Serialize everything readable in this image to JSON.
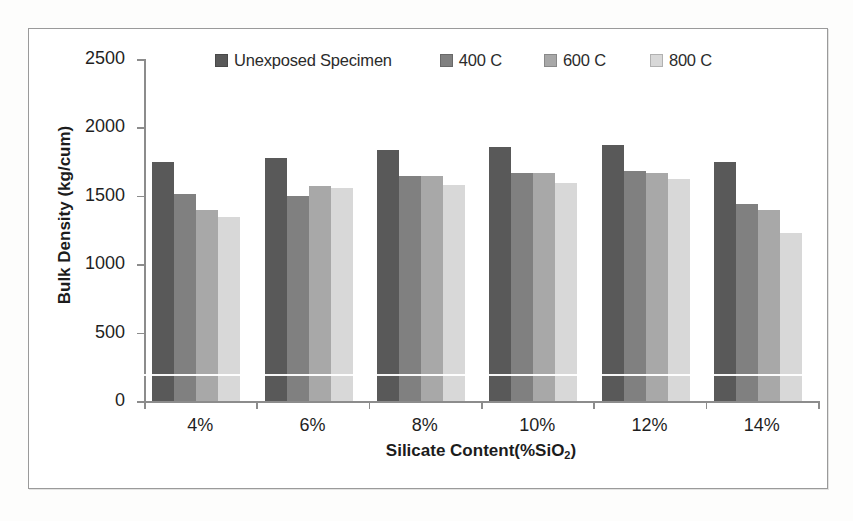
{
  "chart_data": {
    "type": "bar",
    "title": "",
    "xlabel": "Silicate Content(%SiO2)",
    "xlabel_main": "Silicate Content(%SiO",
    "xlabel_sub": "2",
    "xlabel_tail": ")",
    "ylabel": "Bulk Density (kg/cum)",
    "categories": [
      "4%",
      "6%",
      "8%",
      "10%",
      "12%",
      "14%"
    ],
    "ylim": [
      0,
      2500
    ],
    "yticks": [
      0,
      500,
      1000,
      1500,
      2000,
      2500
    ],
    "ytick_labels": [
      "0",
      "500",
      "1000",
      "1500",
      "2000",
      "2500"
    ],
    "grid": false,
    "legend_position": "top",
    "series": [
      {
        "name": "Unexposed Specimen",
        "color": "#595959",
        "values": [
          1745,
          1780,
          1835,
          1860,
          1870,
          1745
        ]
      },
      {
        "name": "400 C",
        "color": "#808080",
        "values": [
          1515,
          1495,
          1645,
          1665,
          1685,
          1440
        ]
      },
      {
        "name": "600 C",
        "color": "#a8a8a8",
        "values": [
          1395,
          1575,
          1645,
          1665,
          1665,
          1395
        ]
      },
      {
        "name": "800 C",
        "color": "#d8d8d8",
        "values": [
          1345,
          1555,
          1580,
          1595,
          1620,
          1230
        ]
      }
    ]
  }
}
